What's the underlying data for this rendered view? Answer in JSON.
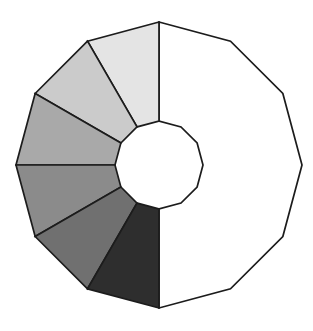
{
  "figure": {
    "shape": "dodecagon-ring",
    "sides": 12,
    "segment_step_deg": 30,
    "total_segments": 12,
    "shaded_count": 6,
    "background": "#ffffff",
    "stroke": {
      "color": "#1c1c1c",
      "width": 1.7
    },
    "geometry": {
      "center_x": 159,
      "center_y": 165,
      "outer_radius": 143,
      "inner_radius": 44,
      "start_angle_deg": 90
    },
    "segments": [
      {
        "name": "unshaded-right-half",
        "from_deg": 90,
        "to_deg": -90,
        "fill": "#ffffff",
        "shaded": false
      },
      {
        "name": "shaded-segment-1",
        "from_deg": 90,
        "to_deg": 120,
        "fill": "#e4e4e4",
        "shaded": true
      },
      {
        "name": "shaded-segment-2",
        "from_deg": 120,
        "to_deg": 150,
        "fill": "#cbcbcb",
        "shaded": true
      },
      {
        "name": "shaded-segment-3",
        "from_deg": 150,
        "to_deg": 180,
        "fill": "#a9a9a9",
        "shaded": true
      },
      {
        "name": "shaded-segment-4",
        "from_deg": 180,
        "to_deg": 210,
        "fill": "#8b8b8b",
        "shaded": true
      },
      {
        "name": "shaded-segment-5",
        "from_deg": 210,
        "to_deg": 240,
        "fill": "#707070",
        "shaded": true
      },
      {
        "name": "shaded-segment-6",
        "from_deg": 240,
        "to_deg": 270,
        "fill": "#2e2e2e",
        "shaded": true
      }
    ]
  }
}
